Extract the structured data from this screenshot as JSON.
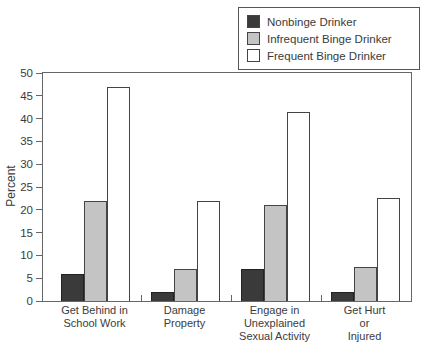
{
  "chart_data": {
    "type": "bar",
    "title": "",
    "xlabel": "",
    "ylabel": "Percent",
    "ylim": [
      0,
      50
    ],
    "yticks": [
      0,
      5,
      10,
      15,
      20,
      25,
      30,
      35,
      40,
      45,
      50
    ],
    "grid": false,
    "legend_position": "top-right",
    "categories": [
      "Get Behind in\nSchool Work",
      "Damage\nProperty",
      "Engage in\nUnexplained\nSexual Activity",
      "Get Hurt\nor Injured"
    ],
    "series": [
      {
        "name": "Nonbinge Drinker",
        "color": "#3a3a3a",
        "values": [
          6,
          2,
          7,
          2
        ]
      },
      {
        "name": "Infrequent Binge Drinker",
        "color": "#c4c4c4",
        "values": [
          22,
          7,
          21,
          7.5
        ]
      },
      {
        "name": "Frequent Binge Drinker",
        "color": "#ffffff",
        "values": [
          47,
          22,
          41.5,
          22.5
        ]
      }
    ]
  },
  "colors": {
    "axis": "#666666",
    "text": "#3b3b3b",
    "bar_border": "#444444",
    "background": "#ffffff"
  }
}
